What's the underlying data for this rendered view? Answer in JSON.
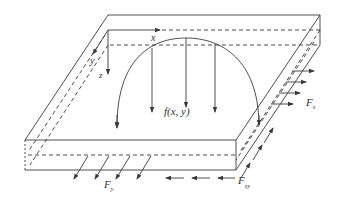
{
  "diagram": {
    "type": "plate-loading-schematic",
    "labels": {
      "x_axis": "x",
      "y_axis": "y",
      "z_axis": "z",
      "load": "f(x, y)",
      "force_x": "F",
      "force_x_sub": "x",
      "force_y": "F",
      "force_y_sub": "y",
      "force_xy": "F",
      "force_xy_sub": "xy"
    },
    "colors": {
      "line": "#3a3a3a",
      "background": "#ffffff"
    },
    "load_arrows_count": 5,
    "fx_arrows_count": 4,
    "fy_arrows_count": 4,
    "fxy_bottom_arrows_count": 3,
    "fxy_side_arrows_count": 3
  }
}
